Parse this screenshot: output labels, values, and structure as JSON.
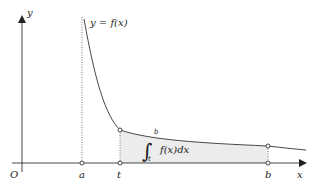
{
  "diagram": {
    "type": "definite-integral-area",
    "curve_label": "y = f(x)",
    "axes": {
      "x_label": "x",
      "y_label": "y",
      "origin_label": "O"
    },
    "points": [
      {
        "name": "a",
        "label": "a"
      },
      {
        "name": "t",
        "label": "t"
      },
      {
        "name": "b",
        "label": "b"
      }
    ],
    "integral": {
      "lower": "t",
      "upper": "b",
      "integrand": "f(x)dx"
    },
    "colors": {
      "axis": "#333333",
      "curve": "#333333",
      "shade": "#ececec",
      "dotted": "#555555"
    }
  }
}
